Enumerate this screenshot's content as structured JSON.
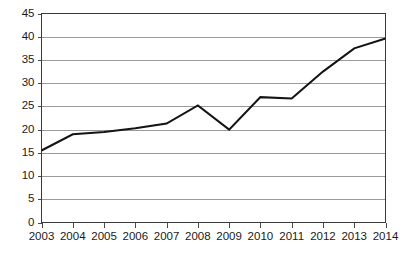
{
  "chart_data": {
    "type": "line",
    "title": "",
    "subtitle": "",
    "xlabel": "",
    "ylabel": "",
    "categories": [
      "2003",
      "2004",
      "2005",
      "2006",
      "2007",
      "2008",
      "2009",
      "2010",
      "2011",
      "2012",
      "2013",
      "2014"
    ],
    "values": [
      15.5,
      19.0,
      19.5,
      20.3,
      21.3,
      25.2,
      20.0,
      27.0,
      26.7,
      32.5,
      37.5,
      39.6
    ],
    "series": [
      {
        "name": "",
        "values": [
          15.5,
          19.0,
          19.5,
          20.3,
          21.3,
          25.2,
          20.0,
          27.0,
          26.7,
          32.5,
          37.5,
          39.6
        ]
      }
    ],
    "ylim": [
      0,
      45
    ],
    "y_ticks": [
      0,
      5,
      10,
      15,
      20,
      25,
      30,
      35,
      40,
      45
    ],
    "y_tick_labels": [
      "0",
      "5",
      "10",
      "15",
      "20",
      "25",
      "30",
      "35",
      "40",
      "45"
    ],
    "x_tick_labels": [
      "2003",
      "2004",
      "2005",
      "2006",
      "2007",
      "2008",
      "2009",
      "2010",
      "2011",
      "2012",
      "2013",
      "2014"
    ],
    "grid": true,
    "grid_axis": "y",
    "legend": false,
    "legend_position": "none",
    "markers": false,
    "annotations": [],
    "colors": {
      "line": "#141414",
      "gridline": "#9a9a9a",
      "frame": "#3a3a3a",
      "background": "#ffffff",
      "text": "#1a1a1a"
    }
  }
}
